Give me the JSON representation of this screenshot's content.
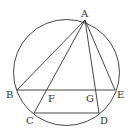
{
  "diagram": {
    "type": "geometry",
    "circle": {
      "cx": 66.5,
      "cy": 72.5,
      "r": 53
    },
    "points": {
      "A": {
        "x": 85,
        "y": 20,
        "label": "A",
        "lx": 81,
        "ly": 17
      },
      "B": {
        "x": 17,
        "y": 90,
        "label": "B",
        "lx": 6,
        "ly": 98
      },
      "C": {
        "x": 34,
        "y": 113,
        "label": "C",
        "lx": 26,
        "ly": 124
      },
      "D": {
        "x": 99,
        "y": 113,
        "label": "D",
        "lx": 100,
        "ly": 124
      },
      "E": {
        "x": 115,
        "y": 90,
        "label": "E",
        "lx": 117,
        "ly": 98
      },
      "F": {
        "x": 46,
        "y": 90,
        "label": "F",
        "lx": 48,
        "ly": 102
      },
      "G": {
        "x": 96,
        "y": 90,
        "label": "G",
        "lx": 86,
        "ly": 102
      }
    },
    "segments": [
      [
        "A",
        "B"
      ],
      [
        "A",
        "C"
      ],
      [
        "A",
        "D"
      ],
      [
        "A",
        "E"
      ],
      [
        "B",
        "E"
      ],
      [
        "C",
        "D"
      ]
    ],
    "stroke_color": "#333333"
  }
}
